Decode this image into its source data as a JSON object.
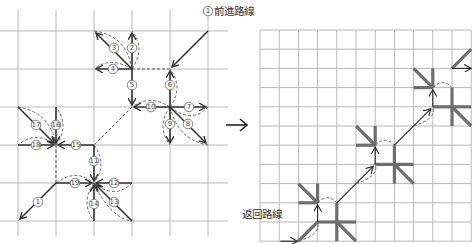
{
  "diagram": {
    "left_panel": {
      "title_label": "前進路線",
      "grid": {
        "cols_x": [
          18,
          56,
          94,
          132,
          170,
          208
        ],
        "rows_y": [
          31,
          69,
          107,
          145,
          183,
          221
        ]
      },
      "start_marker": "1",
      "steps": [
        {
          "n": "1",
          "from": [
            208,
            31
          ],
          "to": [
            170,
            69
          ]
        },
        {
          "n": "2",
          "from": [
            132,
            69
          ],
          "to": [
            132,
            31
          ]
        },
        {
          "n": "3",
          "from": [
            132,
            69
          ],
          "to": [
            94,
            31
          ]
        },
        {
          "n": "4",
          "from": [
            132,
            69
          ],
          "to": [
            94,
            69
          ]
        },
        {
          "n": "5",
          "from": [
            132,
            69
          ],
          "to": [
            132,
            107
          ]
        },
        {
          "n": "6",
          "from": [
            170,
            107
          ],
          "to": [
            170,
            69
          ]
        },
        {
          "n": "7",
          "from": [
            170,
            107
          ],
          "to": [
            208,
            107
          ]
        },
        {
          "n": "8",
          "from": [
            170,
            107
          ],
          "to": [
            208,
            145
          ]
        },
        {
          "n": "9",
          "from": [
            170,
            107
          ],
          "to": [
            170,
            145
          ]
        },
        {
          "n": "10",
          "from": [
            170,
            107
          ],
          "to": [
            132,
            107
          ]
        },
        {
          "n": "11",
          "from": [
            94,
            145
          ],
          "to": [
            94,
            183
          ]
        },
        {
          "n": "12",
          "from": [
            132,
            183
          ],
          "to": [
            94,
            183
          ]
        },
        {
          "n": "13",
          "from": [
            132,
            221
          ],
          "to": [
            94,
            183
          ]
        },
        {
          "n": "14",
          "from": [
            94,
            221
          ],
          "to": [
            94,
            183
          ]
        },
        {
          "n": "15",
          "from": [
            94,
            145
          ],
          "to": [
            56,
            145
          ]
        },
        {
          "n": "16",
          "from": [
            56,
            107
          ],
          "to": [
            56,
            145
          ]
        },
        {
          "n": "17",
          "from": [
            18,
            107
          ],
          "to": [
            56,
            145
          ]
        },
        {
          "n": "18",
          "from": [
            18,
            145
          ],
          "to": [
            56,
            145
          ]
        },
        {
          "n": "19",
          "from": [
            56,
            183
          ],
          "to": [
            94,
            183
          ]
        },
        {
          "n": "1",
          "from": [
            56,
            183
          ],
          "to": [
            18,
            221
          ]
        }
      ]
    },
    "transition_arrow": "→",
    "right_panel": {
      "title_label": "返回路線",
      "grid": {
        "x0": 260,
        "y0": 30,
        "step": 19.2,
        "cols": 12,
        "rows": 12
      }
    }
  }
}
